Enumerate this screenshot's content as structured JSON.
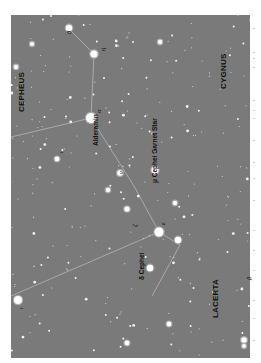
{
  "chart": {
    "background": "#7a7a7a",
    "line_color": "#b5b5b5",
    "constellations": [
      {
        "name": "CEPHEUS",
        "x": 17,
        "y": 112
      },
      {
        "name": "CYGNUS",
        "x": 219,
        "y": 89
      },
      {
        "name": "LACERTA",
        "x": 211,
        "y": 318
      }
    ],
    "star_labels": [
      {
        "name": "Alderamin",
        "x": 92,
        "y": 146
      },
      {
        "name": "μ Cephei   Garnet Star",
        "x": 151,
        "y": 183
      },
      {
        "name": "δ Cephei",
        "x": 138,
        "y": 280
      }
    ],
    "greek_labels": [
      {
        "text": "θ",
        "x": 66,
        "y": 34
      },
      {
        "text": "η",
        "x": 100,
        "y": 51
      },
      {
        "text": "α",
        "x": 96,
        "y": 113
      },
      {
        "text": "ν",
        "x": 118,
        "y": 174
      },
      {
        "text": "ζ",
        "x": 132,
        "y": 227
      },
      {
        "text": "ε",
        "x": 160,
        "y": 225
      },
      {
        "text": "ι",
        "x": 58,
        "y": 153
      },
      {
        "text": "ι",
        "x": 18,
        "y": 309
      },
      {
        "text": "β",
        "x": 246,
        "y": 280
      }
    ],
    "lines": [
      [
        68,
        28,
        94,
        54
      ],
      [
        94,
        54,
        91,
        118
      ],
      [
        91,
        118,
        11,
        137
      ],
      [
        91,
        118,
        134,
        186
      ],
      [
        134,
        186,
        159,
        232
      ],
      [
        159,
        232,
        180,
        245
      ],
      [
        159,
        232,
        11,
        296
      ],
      [
        180,
        245,
        152,
        296
      ]
    ],
    "bright_stars": [
      {
        "x": 69,
        "y": 28,
        "r": 3.2
      },
      {
        "x": 94,
        "y": 54,
        "r": 3.6
      },
      {
        "x": 91,
        "y": 118,
        "r": 5
      },
      {
        "x": 155,
        "y": 170,
        "r": 3.5
      },
      {
        "x": 159,
        "y": 232,
        "r": 4.5
      },
      {
        "x": 178,
        "y": 240,
        "r": 3.2
      },
      {
        "x": 150,
        "y": 268,
        "r": 3.2
      },
      {
        "x": 18,
        "y": 300,
        "r": 4
      },
      {
        "x": 120,
        "y": 173,
        "r": 2.8
      },
      {
        "x": 127,
        "y": 209,
        "r": 2.6
      },
      {
        "x": 16,
        "y": 67,
        "r": 2.2
      },
      {
        "x": 57,
        "y": 159,
        "r": 2.4
      },
      {
        "x": 32,
        "y": 44,
        "r": 2
      },
      {
        "x": 108,
        "y": 190,
        "r": 2.2
      },
      {
        "x": 160,
        "y": 42,
        "r": 2.2
      },
      {
        "x": 244,
        "y": 340,
        "r": 2.8
      },
      {
        "x": 244,
        "y": 346,
        "r": 2
      },
      {
        "x": 127,
        "y": 343,
        "r": 2.4
      },
      {
        "x": 169,
        "y": 324,
        "r": 2.4
      },
      {
        "x": 175,
        "y": 203,
        "r": 2.2
      }
    ]
  }
}
